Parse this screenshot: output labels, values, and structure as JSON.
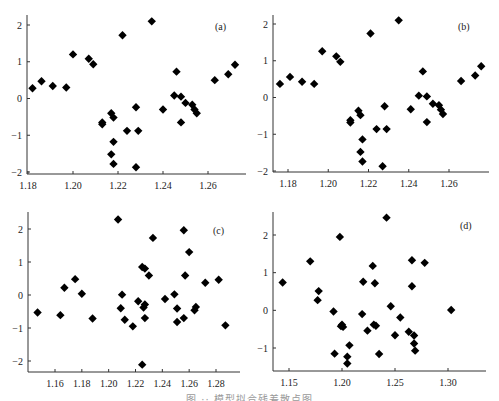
{
  "figure": {
    "caption": "图 ·· 模型拟合残差散点图"
  },
  "chart_data": [
    {
      "type": "scatter",
      "label": "(a)",
      "title": "",
      "xlabel": "",
      "ylabel": "",
      "xlim": [
        1.18,
        1.275
      ],
      "ylim": [
        -2.05,
        2.25
      ],
      "xticks": [
        1.18,
        1.2,
        1.22,
        1.24,
        1.26
      ],
      "xtick_labels": [
        "1.18",
        "1.20",
        "1.22",
        "1.24",
        "1.26"
      ],
      "yticks": [
        2,
        1,
        0,
        -1,
        -2
      ],
      "ytick_labels": [
        "2",
        "1",
        "0",
        "−1",
        "−2"
      ],
      "grid": false,
      "marker": "diamond",
      "points": [
        [
          1.182,
          0.28
        ],
        [
          1.186,
          0.47
        ],
        [
          1.191,
          0.34
        ],
        [
          1.197,
          0.3
        ],
        [
          1.2,
          1.2
        ],
        [
          1.207,
          1.08
        ],
        [
          1.209,
          0.93
        ],
        [
          1.213,
          -0.7
        ],
        [
          1.213,
          -0.65
        ],
        [
          1.217,
          -0.4
        ],
        [
          1.218,
          -0.52
        ],
        [
          1.218,
          -1.18
        ],
        [
          1.217,
          -1.52
        ],
        [
          1.218,
          -1.78
        ],
        [
          1.222,
          1.72
        ],
        [
          1.224,
          -0.88
        ],
        [
          1.228,
          -0.24
        ],
        [
          1.229,
          -0.88
        ],
        [
          1.228,
          -1.87
        ],
        [
          1.235,
          2.1
        ],
        [
          1.24,
          -0.3
        ],
        [
          1.245,
          0.08
        ],
        [
          1.246,
          0.73
        ],
        [
          1.248,
          0.05
        ],
        [
          1.248,
          -0.65
        ],
        [
          1.25,
          -0.12
        ],
        [
          1.253,
          -0.17
        ],
        [
          1.254,
          -0.3
        ],
        [
          1.255,
          -0.4
        ],
        [
          1.263,
          0.5
        ],
        [
          1.269,
          0.66
        ],
        [
          1.272,
          0.92
        ]
      ]
    },
    {
      "type": "scatter",
      "label": "(b)",
      "title": "",
      "xlabel": "",
      "ylabel": "",
      "xlim": [
        1.172,
        1.28
      ],
      "ylim": [
        -2.05,
        2.25
      ],
      "xticks": [
        1.18,
        1.2,
        1.22,
        1.24,
        1.26
      ],
      "xtick_labels": [
        "1.18",
        "1.20",
        "1.22",
        "1.24",
        "1.26"
      ],
      "yticks": [
        2,
        1,
        0,
        -1,
        -2
      ],
      "ytick_labels": [
        "2",
        "1",
        "0",
        "−1",
        "−2"
      ],
      "grid": false,
      "marker": "diamond",
      "points": [
        [
          1.176,
          0.37
        ],
        [
          1.181,
          0.56
        ],
        [
          1.187,
          0.43
        ],
        [
          1.193,
          0.37
        ],
        [
          1.197,
          1.26
        ],
        [
          1.204,
          1.12
        ],
        [
          1.206,
          0.97
        ],
        [
          1.211,
          -0.68
        ],
        [
          1.211,
          -0.62
        ],
        [
          1.215,
          -0.36
        ],
        [
          1.216,
          -0.48
        ],
        [
          1.217,
          -1.14
        ],
        [
          1.216,
          -1.48
        ],
        [
          1.217,
          -1.74
        ],
        [
          1.221,
          1.74
        ],
        [
          1.224,
          -0.86
        ],
        [
          1.228,
          -0.24
        ],
        [
          1.229,
          -0.86
        ],
        [
          1.227,
          -1.87
        ],
        [
          1.235,
          2.1
        ],
        [
          1.241,
          -0.32
        ],
        [
          1.245,
          0.05
        ],
        [
          1.247,
          0.71
        ],
        [
          1.249,
          0.03
        ],
        [
          1.249,
          -0.67
        ],
        [
          1.252,
          -0.17
        ],
        [
          1.255,
          -0.21
        ],
        [
          1.256,
          -0.33
        ],
        [
          1.257,
          -0.45
        ],
        [
          1.266,
          0.45
        ],
        [
          1.273,
          0.6
        ],
        [
          1.276,
          0.85
        ]
      ]
    },
    {
      "type": "scatter",
      "label": "(c)",
      "title": "",
      "xlabel": "",
      "ylabel": "",
      "xlim": [
        1.144,
        1.292
      ],
      "ylim": [
        -2.3,
        2.45
      ],
      "xticks": [
        1.16,
        1.18,
        1.2,
        1.22,
        1.24,
        1.26,
        1.28
      ],
      "xtick_labels": [
        "1.16",
        "1.18",
        "1.20",
        "1.22",
        "1.24",
        "1.26",
        "1.28"
      ],
      "yticks": [
        2,
        1,
        0,
        -1,
        -2
      ],
      "ytick_labels": [
        "2",
        "1",
        "0",
        "−1",
        "−2"
      ],
      "grid": false,
      "marker": "diamond",
      "points": [
        [
          1.147,
          -0.53
        ],
        [
          1.164,
          -0.61
        ],
        [
          1.167,
          0.22
        ],
        [
          1.175,
          0.48
        ],
        [
          1.18,
          0.04
        ],
        [
          1.188,
          -0.71
        ],
        [
          1.207,
          2.29
        ],
        [
          1.209,
          -0.4
        ],
        [
          1.21,
          0.01
        ],
        [
          1.212,
          -0.75
        ],
        [
          1.218,
          -0.95
        ],
        [
          1.222,
          -0.19
        ],
        [
          1.225,
          0.85
        ],
        [
          1.227,
          0.8
        ],
        [
          1.23,
          0.59
        ],
        [
          1.233,
          1.73
        ],
        [
          1.226,
          -0.38
        ],
        [
          1.227,
          -0.29
        ],
        [
          1.227,
          -0.7
        ],
        [
          1.225,
          -2.11
        ],
        [
          1.242,
          -0.12
        ],
        [
          1.249,
          0.02
        ],
        [
          1.251,
          -0.41
        ],
        [
          1.251,
          -0.82
        ],
        [
          1.256,
          1.96
        ],
        [
          1.257,
          0.59
        ],
        [
          1.256,
          -0.7
        ],
        [
          1.26,
          1.3
        ],
        [
          1.264,
          -0.46
        ],
        [
          1.265,
          -0.36
        ],
        [
          1.272,
          0.37
        ],
        [
          1.282,
          0.46
        ],
        [
          1.287,
          -0.92
        ]
      ]
    },
    {
      "type": "scatter",
      "label": "(d)",
      "title": "",
      "xlabel": "",
      "ylabel": "",
      "xlim": [
        1.135,
        1.31
      ],
      "ylim": [
        -1.6,
        2.6
      ],
      "xticks": [
        1.15,
        1.2,
        1.25,
        1.3
      ],
      "xtick_labels": [
        "1.15",
        "1.20",
        "1.25",
        "1.30"
      ],
      "yticks": [
        2,
        1,
        0,
        -1
      ],
      "ytick_labels": [
        "2",
        "1",
        "0",
        "−1"
      ],
      "grid": false,
      "marker": "diamond",
      "points": [
        [
          1.144,
          0.74
        ],
        [
          1.17,
          1.3
        ],
        [
          1.178,
          0.51
        ],
        [
          1.177,
          0.27
        ],
        [
          1.192,
          -0.03
        ],
        [
          1.193,
          -1.15
        ],
        [
          1.198,
          1.95
        ],
        [
          1.2,
          -0.38
        ],
        [
          1.201,
          -0.44
        ],
        [
          1.199,
          -0.42
        ],
        [
          1.205,
          -1.23
        ],
        [
          1.205,
          -1.41
        ],
        [
          1.207,
          -0.93
        ],
        [
          1.22,
          0.76
        ],
        [
          1.219,
          -0.1
        ],
        [
          1.224,
          -0.54
        ],
        [
          1.229,
          1.18
        ],
        [
          1.231,
          0.72
        ],
        [
          1.23,
          -0.38
        ],
        [
          1.232,
          -0.41
        ],
        [
          1.235,
          -1.16
        ],
        [
          1.242,
          2.46
        ],
        [
          1.246,
          0.11
        ],
        [
          1.25,
          -0.66
        ],
        [
          1.255,
          -0.19
        ],
        [
          1.263,
          -0.57
        ],
        [
          1.266,
          1.33
        ],
        [
          1.266,
          0.64
        ],
        [
          1.268,
          -0.67
        ],
        [
          1.268,
          -0.88
        ],
        [
          1.269,
          -1.07
        ],
        [
          1.278,
          1.26
        ],
        [
          1.303,
          0.01
        ]
      ]
    }
  ]
}
